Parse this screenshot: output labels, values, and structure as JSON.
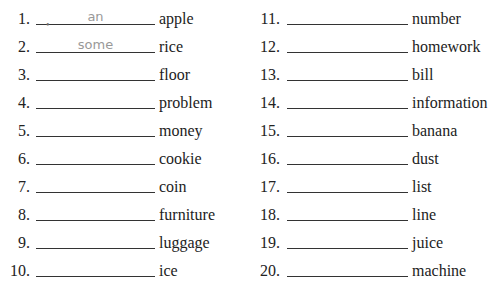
{
  "items": [
    {
      "n": "1.",
      "answer": "an",
      "word": "apple"
    },
    {
      "n": "2.",
      "answer": "some",
      "word": "rice"
    },
    {
      "n": "3.",
      "answer": "",
      "word": "floor"
    },
    {
      "n": "4.",
      "answer": "",
      "word": "problem"
    },
    {
      "n": "5.",
      "answer": "",
      "word": "money"
    },
    {
      "n": "6.",
      "answer": "",
      "word": "cookie"
    },
    {
      "n": "7.",
      "answer": "",
      "word": "coin"
    },
    {
      "n": "8.",
      "answer": "",
      "word": "furniture"
    },
    {
      "n": "9.",
      "answer": "",
      "word": "luggage"
    },
    {
      "n": "10.",
      "answer": "",
      "word": "ice"
    },
    {
      "n": "11.",
      "answer": "",
      "word": "number"
    },
    {
      "n": "12.",
      "answer": "",
      "word": "homework"
    },
    {
      "n": "13.",
      "answer": "",
      "word": "bill"
    },
    {
      "n": "14.",
      "answer": "",
      "word": "information"
    },
    {
      "n": "15.",
      "answer": "",
      "word": "banana"
    },
    {
      "n": "16.",
      "answer": "",
      "word": "dust"
    },
    {
      "n": "17.",
      "answer": "",
      "word": "list"
    },
    {
      "n": "18.",
      "answer": "",
      "word": "line"
    },
    {
      "n": "19.",
      "answer": "",
      "word": "juice"
    },
    {
      "n": "20.",
      "answer": "",
      "word": "machine"
    }
  ],
  "first_mark": "•"
}
